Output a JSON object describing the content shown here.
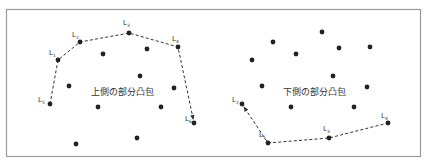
{
  "panels": [
    {
      "id": "upper",
      "caption": "上側の部分凸包",
      "hull_labels": [
        "L",
        "L",
        "L",
        "L",
        "L",
        "L"
      ],
      "hull_label_subs": [
        "1",
        "2",
        "3",
        "4",
        "5",
        "6"
      ],
      "hull_points": [
        [
          50,
          104
        ],
        [
          58,
          60
        ],
        [
          80,
          42
        ],
        [
          129,
          33
        ],
        [
          178,
          47
        ],
        [
          194,
          123
        ]
      ],
      "label_order": [
        4,
        0,
        1,
        2,
        3,
        5
      ],
      "arrow_end": "last",
      "interior_points": [
        [
          103,
          54
        ],
        [
          147,
          49
        ],
        [
          140,
          76
        ],
        [
          69,
          86
        ],
        [
          174,
          88
        ],
        [
          98,
          107
        ],
        [
          161,
          107
        ],
        [
          76,
          144
        ],
        [
          137,
          138
        ]
      ]
    },
    {
      "id": "lower",
      "caption": "下側の部分凸包",
      "hull_labels": [
        "L",
        "L",
        "L",
        "L"
      ],
      "hull_label_subs": [
        "1",
        "2",
        "3",
        "4"
      ],
      "hull_points": [
        [
          242,
          104
        ],
        [
          268,
          143
        ],
        [
          329,
          138
        ],
        [
          388,
          123
        ]
      ],
      "label_order": [
        1,
        0,
        2,
        3
      ],
      "arrow_end": "first",
      "interior_points": [
        [
          252,
          60
        ],
        [
          273,
          42
        ],
        [
          296,
          54
        ],
        [
          322,
          32
        ],
        [
          339,
          48
        ],
        [
          370,
          47
        ],
        [
          333,
          76
        ],
        [
          262,
          86
        ],
        [
          367,
          87
        ],
        [
          291,
          107
        ],
        [
          354,
          107
        ]
      ]
    }
  ]
}
